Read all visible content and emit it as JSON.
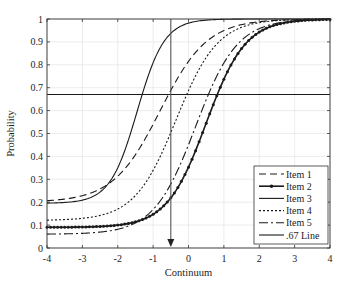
{
  "chart_data": {
    "type": "line",
    "title": "",
    "xlabel": "Continuum",
    "ylabel": "Probability",
    "xlim": [
      -4,
      4
    ],
    "ylim": [
      0,
      1
    ],
    "x_ticks": [
      "-4",
      "-3",
      "-2",
      "-1",
      "0",
      "1",
      "2",
      "3",
      "4"
    ],
    "y_ticks": [
      "0",
      "0.1",
      "0.2",
      "0.3",
      "0.4",
      "0.5",
      "0.6",
      "0.7",
      "0.8",
      "0.9",
      "1"
    ],
    "grid": true,
    "legend_position": "lower right",
    "series": [
      {
        "name": "Item 1",
        "style": "dashed",
        "lower": 0.2,
        "upper": 1.0,
        "location": -0.8,
        "slope": 1.5,
        "x": [
          -4,
          -3,
          -2,
          -1,
          0,
          1,
          2,
          3,
          4
        ],
        "values": [
          0.22,
          0.25,
          0.35,
          0.59,
          0.84,
          0.96,
          0.99,
          1.0,
          1.0
        ]
      },
      {
        "name": "Item 2",
        "style": "solid-markers",
        "lower": 0.09,
        "upper": 1.0,
        "location": 0.5,
        "slope": 1.8,
        "x": [
          -4,
          -3,
          -2,
          -1,
          0,
          1,
          2,
          3,
          4
        ],
        "values": [
          0.09,
          0.09,
          0.1,
          0.15,
          0.38,
          0.78,
          0.96,
          0.99,
          1.0
        ]
      },
      {
        "name": "Item 3",
        "style": "solid",
        "lower": 0.195,
        "upper": 1.0,
        "location": -1.45,
        "slope": 2.6,
        "x": [
          -4,
          -3,
          -2,
          -1,
          0,
          1,
          2,
          3,
          4
        ],
        "values": [
          0.2,
          0.21,
          0.37,
          0.82,
          0.98,
          1.0,
          1.0,
          1.0,
          1.0
        ]
      },
      {
        "name": "Item 4",
        "style": "dotted",
        "lower": 0.12,
        "upper": 1.0,
        "location": -0.35,
        "slope": 1.7,
        "x": [
          -4,
          -3,
          -2,
          -1,
          0,
          1,
          2,
          3,
          4
        ],
        "values": [
          0.12,
          0.13,
          0.17,
          0.36,
          0.74,
          0.94,
          0.99,
          1.0,
          1.0
        ]
      },
      {
        "name": "Item 5",
        "style": "dash-dot",
        "lower": 0.06,
        "upper": 1.0,
        "location": 0.2,
        "slope": 1.7,
        "x": [
          -4,
          -3,
          -2,
          -1,
          0,
          1,
          2,
          3,
          4
        ],
        "values": [
          0.06,
          0.07,
          0.09,
          0.19,
          0.55,
          0.88,
          0.98,
          1.0,
          1.0
        ]
      },
      {
        "name": ".67 Line",
        "style": "solid",
        "constant": 0.67,
        "x": [
          -4,
          4
        ],
        "values": [
          0.67,
          0.67
        ]
      }
    ],
    "annotations": [
      {
        "type": "vertical-arrow",
        "x": -0.5,
        "from_y": 1.0,
        "to_y": 0.0,
        "direction": "down"
      }
    ]
  },
  "legend": {
    "items": [
      {
        "label": "Item 1"
      },
      {
        "label": "Item 2"
      },
      {
        "label": "Item 3"
      },
      {
        "label": "Item 4"
      },
      {
        "label": "Item 5"
      },
      {
        "label": ".67 Line"
      }
    ]
  },
  "axes": {
    "xlabel": "Continuum",
    "ylabel": "Probability"
  }
}
